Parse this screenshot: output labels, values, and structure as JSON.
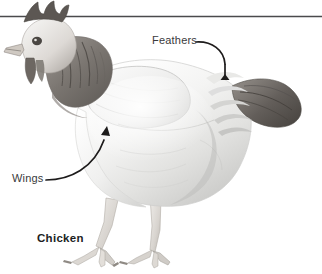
{
  "figure": {
    "kind": "labeled-photograph",
    "subject": "chicken",
    "caption": "Chicken",
    "background_color": "#ffffff",
    "rule": {
      "name": "horizontal-rule",
      "color": "#4a4a4c",
      "y": 16,
      "thickness": 1.6
    },
    "callouts": [
      {
        "id": "feathers",
        "label": "Feathers",
        "text_color": "#3a3a3c",
        "leader_color": "#1d1b1b",
        "points_to": "tail and back plumage",
        "arrow_tip": [
          222,
          82
        ]
      },
      {
        "id": "wings",
        "label": "Wings",
        "text_color": "#3a3a3c",
        "leader_color": "#1d1b1b",
        "points_to": "folded wing on body side",
        "arrow_tip": [
          107,
          126
        ]
      }
    ],
    "palette": {
      "paper": "#ffffff",
      "body_light": "#f3f3f2",
      "body_mid": "#dcdcdb",
      "body_shadow": "#b9b9b8",
      "neck_dark": "#6e6a66",
      "comb_dark": "#55504d",
      "tail_dark": "#5c5854",
      "leg_tone": "#cfcbc6",
      "ink": "#1d1b1b"
    }
  }
}
